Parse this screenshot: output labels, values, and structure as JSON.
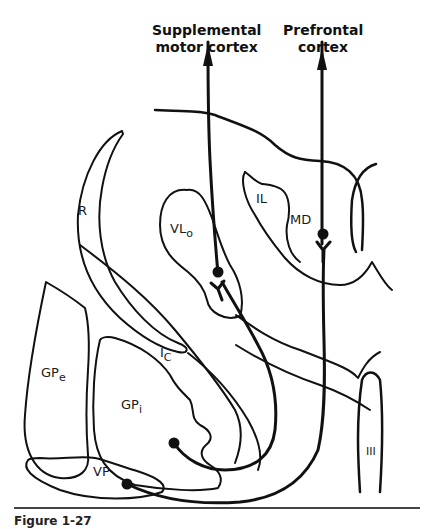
{
  "diagram": {
    "type": "neuroanatomy-pathway",
    "targets": [
      {
        "id": "sma",
        "line1": "Supplemental",
        "line2": "motor cortex"
      },
      {
        "id": "pfc",
        "line1": "Prefrontal",
        "line2": "cortex"
      }
    ],
    "structures": {
      "R": "R",
      "VLo": {
        "main": "VL",
        "sub": "o"
      },
      "IL": "IL",
      "MD": "MD",
      "IC": {
        "main": "I",
        "sub": "C"
      },
      "GPe": {
        "main": "GP",
        "sub": "e"
      },
      "GPi": {
        "main": "GP",
        "sub": "i"
      },
      "VP": "VP",
      "III": "III"
    },
    "pathways": [
      {
        "from": "GPi",
        "relay": "VLo",
        "to": "Supplemental motor cortex"
      },
      {
        "from": "VP",
        "relay": "MD",
        "to": "Prefrontal cortex"
      }
    ],
    "colors": {
      "line": "#111111",
      "background": "#ffffff"
    }
  },
  "caption": {
    "text": "Figure 1-27"
  }
}
